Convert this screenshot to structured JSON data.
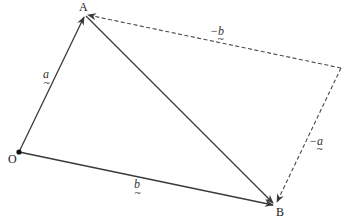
{
  "diagram": {
    "title": "",
    "points": {
      "O": {
        "label": "O",
        "x": 19,
        "y": 152
      },
      "A": {
        "label": "A",
        "x": 85,
        "y": 15
      },
      "B": {
        "label": "B",
        "x": 275,
        "y": 205
      },
      "C": {
        "label": "",
        "x": 341,
        "y": 68
      }
    },
    "vectors": [
      {
        "id": "OA",
        "from": "O",
        "to": "A",
        "label": "a",
        "style": "solid"
      },
      {
        "id": "OB",
        "from": "O",
        "to": "B",
        "label": "b",
        "style": "solid"
      },
      {
        "id": "AB",
        "from": "A",
        "to": "B",
        "label": "",
        "style": "solid"
      },
      {
        "id": "CA",
        "from": "C",
        "to": "A",
        "label": "−b",
        "style": "dashed"
      },
      {
        "id": "CB",
        "from": "C",
        "to": "B",
        "label": "−a",
        "style": "dashed"
      }
    ],
    "labels": {
      "O": "O",
      "A": "A",
      "B": "B",
      "a": "a",
      "b": "b",
      "neg_b": "−b",
      "neg_a": "−a",
      "tilde": "~"
    },
    "colors": {
      "line": "#3a3a3a",
      "text": "#222222",
      "background": "#ffffff"
    }
  }
}
